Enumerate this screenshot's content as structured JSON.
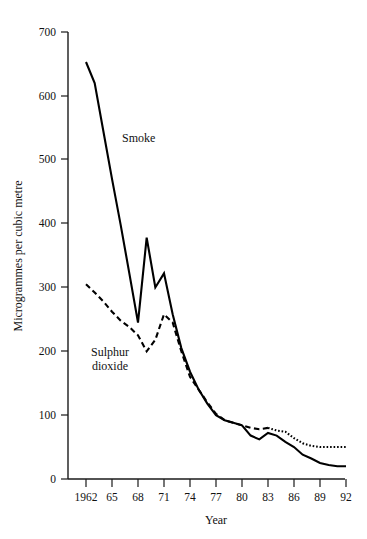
{
  "chart_data": {
    "type": "line",
    "title": "",
    "subtitle": "",
    "xlabel": "Year",
    "ylabel": "Microgrammes per cubic metre",
    "xlim": [
      1962,
      1992
    ],
    "ylim": [
      0,
      700
    ],
    "grid": false,
    "legend_position": "inline-annotations",
    "x_tick_labels": [
      "1962",
      "65",
      "68",
      "71",
      "74",
      "77",
      "80",
      "83",
      "86",
      "89",
      "92"
    ],
    "x_tick_values": [
      1962,
      1965,
      1968,
      1971,
      1974,
      1977,
      1980,
      1983,
      1986,
      1989,
      1992
    ],
    "y_tick_labels": [
      "0",
      "100",
      "200",
      "300",
      "400",
      "500",
      "600",
      "700"
    ],
    "y_tick_values": [
      0,
      100,
      200,
      300,
      400,
      500,
      600,
      700
    ],
    "x": [
      1962,
      1963,
      1964,
      1965,
      1966,
      1967,
      1968,
      1969,
      1970,
      1971,
      1972,
      1973,
      1974,
      1975,
      1976,
      1977,
      1978,
      1979,
      1980,
      1981,
      1982,
      1983,
      1984,
      1985,
      1986,
      1987,
      1988,
      1989,
      1990,
      1991,
      1992
    ],
    "series": [
      {
        "name": "Smoke",
        "style": "solid",
        "color": "#000000",
        "label_x": 1968.6,
        "label_y": 516,
        "values": [
          653,
          620,
          545,
          470,
          398,
          322,
          245,
          378,
          300,
          322,
          258,
          205,
          168,
          140,
          118,
          100,
          92,
          88,
          84,
          68,
          62,
          72,
          68,
          58,
          50,
          38,
          32,
          25,
          22,
          20,
          20
        ]
      },
      {
        "name": "Sulphur dioxide",
        "style": "dashed-then-dotted",
        "color": "#000000",
        "dot_transition_year": 1983,
        "label_x": 1964.2,
        "label_y": 205,
        "values": [
          305,
          292,
          278,
          262,
          248,
          238,
          225,
          200,
          218,
          258,
          245,
          200,
          160,
          140,
          120,
          102,
          92,
          88,
          84,
          80,
          78,
          80,
          76,
          74,
          64,
          56,
          52,
          50,
          50,
          50,
          50
        ]
      }
    ],
    "annotations": [
      {
        "text": "Smoke",
        "name": "smoke-series-label"
      },
      {
        "text": "Sulphur",
        "name": "so2-series-label-line1"
      },
      {
        "text": "dioxide",
        "name": "so2-series-label-line2"
      }
    ]
  },
  "axes": {
    "y_title": "Microgrammes per cubic metre",
    "x_title": "Year"
  },
  "colors": {
    "ink": "#000000",
    "axis": "#1a1a1a",
    "background": "#ffffff"
  }
}
